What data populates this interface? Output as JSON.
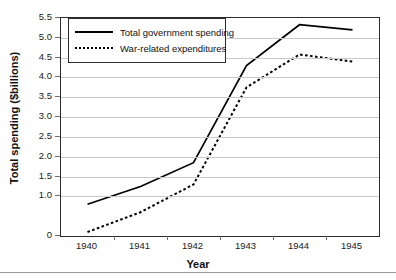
{
  "chart_data": {
    "type": "line",
    "title": "",
    "xlabel": "Year",
    "ylabel": "Total spending ($billions)",
    "categories": [
      "1940",
      "1941",
      "1942",
      "1943",
      "1944",
      "1945"
    ],
    "ylim": [
      0,
      5.5
    ],
    "ytick_labels": [
      "0",
      "1.0",
      "1.5",
      "2.0",
      "2.5",
      "3.0",
      "3.5",
      "4.0",
      "4.5",
      "5.0",
      "5.5"
    ],
    "ytick_values": [
      0,
      1.0,
      1.5,
      2.0,
      2.5,
      3.0,
      3.5,
      4.0,
      4.5,
      5.0,
      5.5
    ],
    "grid": true,
    "legend_position": "top-left",
    "series": [
      {
        "name": "Total government spending",
        "style": "solid",
        "color": "#000000",
        "values": [
          0.8,
          1.25,
          1.85,
          4.3,
          5.33,
          5.2
        ]
      },
      {
        "name": "War-related expenditures",
        "style": "dotted",
        "color": "#000000",
        "values": [
          0.1,
          0.6,
          1.3,
          3.75,
          4.58,
          4.4
        ]
      }
    ]
  }
}
